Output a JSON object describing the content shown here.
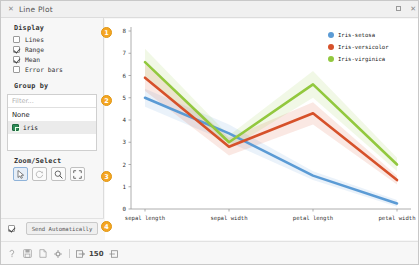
{
  "window": {
    "title": "Line Plot",
    "close_icon": "close-icon",
    "maximize_icon": "maximize-icon",
    "window_close_icon": "close-icon"
  },
  "display": {
    "title": "Display",
    "options": [
      {
        "label": "Lines",
        "checked": false
      },
      {
        "label": "Range",
        "checked": true
      },
      {
        "label": "Mean",
        "checked": true
      },
      {
        "label": "Error bars",
        "checked": false
      }
    ]
  },
  "group_by": {
    "title": "Group by",
    "filter_placeholder": "Filter...",
    "items": [
      {
        "label": "None",
        "selected": false,
        "icon": ""
      },
      {
        "label": "iris",
        "selected": true,
        "icon": "discrete-variable-icon"
      }
    ]
  },
  "zoom_select": {
    "title": "Zoom/Select",
    "buttons": [
      {
        "name": "select-tool",
        "icon": "cursor-arrow-icon",
        "active": true
      },
      {
        "name": "pan-tool",
        "icon": "reset-rotate-icon",
        "active": false
      },
      {
        "name": "zoom-tool",
        "icon": "magnifier-icon",
        "active": false
      },
      {
        "name": "fit-tool",
        "icon": "expand-fit-icon",
        "active": false
      }
    ]
  },
  "send": {
    "checked": true,
    "label": "Send Automatically"
  },
  "statusbar": {
    "icons": [
      "help-icon",
      "save-icon",
      "report-icon",
      "settings-icon"
    ],
    "input_icon": "input-arrow-icon",
    "count": "150",
    "output_icon": "output-arrow-icon"
  },
  "badges": [
    {
      "number": "1"
    },
    {
      "number": "2"
    },
    {
      "number": "3"
    },
    {
      "number": "4"
    }
  ],
  "colors": {
    "setosa": "#5b9bd5",
    "versicolor": "#d6512a",
    "virginica": "#92c83e",
    "badge": "#f5a623"
  },
  "chart_data": {
    "type": "line",
    "title": "",
    "xlabel": "",
    "ylabel": "",
    "categories": [
      "sepal length",
      "sepal width",
      "petal length",
      "petal width"
    ],
    "ylim": [
      0,
      8
    ],
    "yticks": [
      0,
      1,
      2,
      3,
      4,
      5,
      6,
      7,
      8
    ],
    "grid": false,
    "legend_position": "top-right",
    "series": [
      {
        "name": "Iris-setosa",
        "color": "#5b9bd5",
        "values": [
          5.0,
          3.4,
          1.5,
          0.25
        ]
      },
      {
        "name": "Iris-versicolor",
        "color": "#d6512a",
        "values": [
          5.9,
          2.8,
          4.3,
          1.3
        ]
      },
      {
        "name": "Iris-virginica",
        "color": "#92c83e",
        "values": [
          6.6,
          3.0,
          5.6,
          2.0
        ]
      }
    ],
    "bands": [
      {
        "name": "Iris-setosa",
        "lower": [
          4.6,
          3.0,
          1.3,
          0.1
        ],
        "upper": [
          5.4,
          3.8,
          1.7,
          0.4
        ]
      },
      {
        "name": "Iris-versicolor",
        "lower": [
          5.3,
          2.4,
          3.8,
          1.1
        ],
        "upper": [
          6.5,
          3.2,
          4.8,
          1.5
        ]
      },
      {
        "name": "Iris-virginica",
        "lower": [
          6.0,
          2.7,
          5.0,
          1.7
        ],
        "upper": [
          7.2,
          3.3,
          6.2,
          2.3
        ]
      }
    ]
  }
}
